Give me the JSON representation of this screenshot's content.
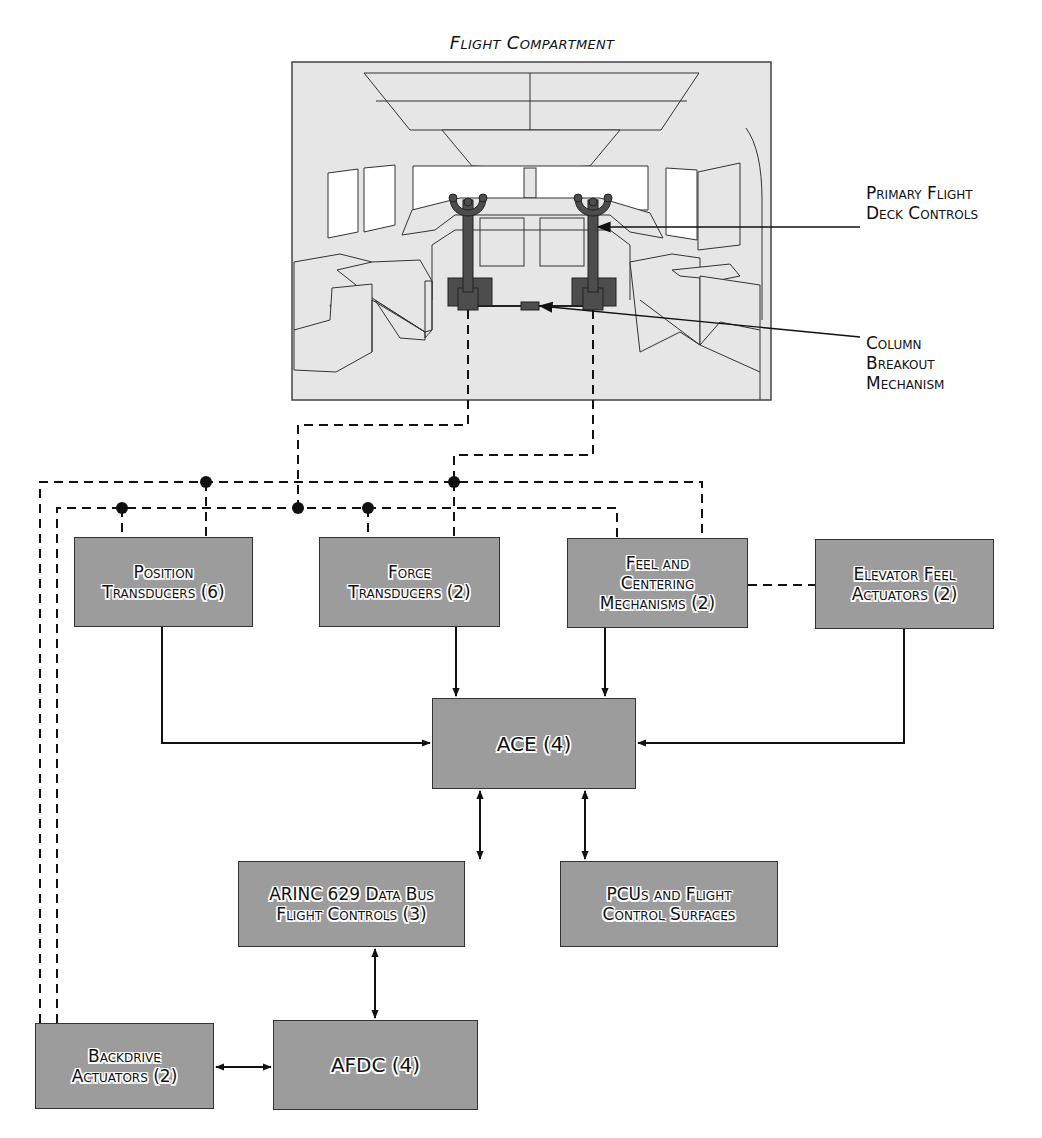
{
  "flight_compartment": {
    "title": "Flight Compartment",
    "callouts": [
      {
        "id": "primary-flight-deck-controls",
        "label": "Primary Flight\nDeck Controls"
      },
      {
        "id": "column-breakout-mechanism",
        "label": "Column\nBreakout\nMechanism"
      }
    ]
  },
  "boxes": {
    "position_transducers": "Position\nTransducers (6)",
    "force_transducers": "Force\nTransducers (2)",
    "feel_centering": "Feel and\nCentering\nMechanisms (2)",
    "elevator_feel": "Elevator Feel\nActuators (2)",
    "ace": "ACE (4)",
    "arinc": "ARINC 629 Data Bus\nFlight Controls (3)",
    "pcus": "PCUs and Flight\nControl Surfaces",
    "backdrive": "Backdrive\nActuators (2)",
    "afdc": "AFDC (4)"
  },
  "connections": [
    {
      "from": "Position Transducers (6)",
      "to": "ACE (4)",
      "type": "arrow"
    },
    {
      "from": "Force Transducers (2)",
      "to": "ACE (4)",
      "type": "arrow"
    },
    {
      "from": "Feel and Centering Mechanisms (2)",
      "to": "ACE (4)",
      "type": "arrow"
    },
    {
      "from": "Elevator Feel Actuators (2)",
      "to": "ACE (4)",
      "type": "arrow"
    },
    {
      "from": "ACE (4)",
      "to": "ARINC 629 Data Bus Flight Controls (3)",
      "type": "bidirectional"
    },
    {
      "from": "ACE (4)",
      "to": "PCUs and Flight Control Surfaces",
      "type": "bidirectional"
    },
    {
      "from": "ARINC 629 Data Bus Flight Controls (3)",
      "to": "AFDC (4)",
      "type": "bidirectional"
    },
    {
      "from": "Backdrive Actuators (2)",
      "to": "AFDC (4)",
      "type": "bidirectional"
    },
    {
      "from": "Feel and Centering Mechanisms (2)",
      "to": "Elevator Feel Actuators (2)",
      "type": "mechanical-dashed"
    },
    {
      "from": "Primary Flight Deck Controls",
      "to": "Position/Force Transducers, Feel and Centering, Backdrive Actuators",
      "type": "mechanical-dashed"
    }
  ],
  "colors": {
    "box_fill": "#9c9c9c",
    "box_border": "#333333",
    "compartment_fill": "#e6e6e6",
    "control_column": "#4a4a4a",
    "line": "#111111"
  }
}
